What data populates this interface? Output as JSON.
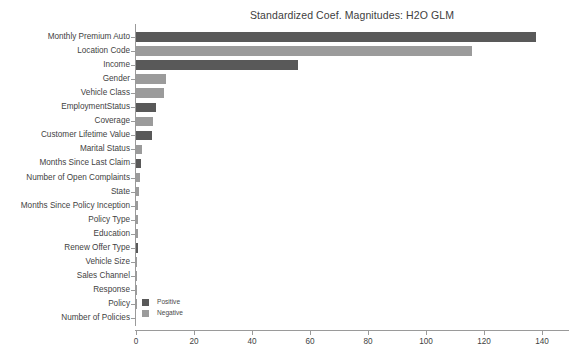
{
  "chart_data": {
    "type": "bar",
    "orientation": "horizontal",
    "title": "Standardized Coef. Magnitudes: H2O GLM",
    "xlabel": "",
    "ylabel": "",
    "xlim": [
      0,
      140
    ],
    "xticks": [
      0,
      20,
      40,
      60,
      80,
      100,
      120,
      140
    ],
    "xtick_labels": [
      "0",
      "20",
      "40",
      "60",
      "80",
      "100",
      "120",
      "140"
    ],
    "grid": false,
    "legend": {
      "position": "lower-left-inside",
      "entries": [
        {
          "label": "Positive",
          "color": "#595959"
        },
        {
          "label": "Negative",
          "color": "#9b9b9b"
        }
      ]
    },
    "categories": [
      "Monthly Premium Auto",
      "Location Code",
      "Income",
      "Gender",
      "Vehicle Class",
      "EmploymentStatus",
      "Coverage",
      "Customer Lifetime Value",
      "Marital Status",
      "Months Since Last Claim",
      "Number of Open Complaints",
      "State",
      "Months Since Policy Inception",
      "Policy Type",
      "Education",
      "Renew Offer Type",
      "Vehicle Size",
      "Sales Channel",
      "Response",
      "Policy",
      "Number of Policies"
    ],
    "values": [
      138.0,
      116.0,
      56.0,
      10.5,
      9.5,
      7.0,
      6.0,
      5.5,
      1.9,
      1.6,
      1.5,
      1.1,
      0.7,
      0.6,
      0.6,
      0.8,
      0.5,
      0.15,
      0.1,
      0.05,
      0.0
    ],
    "signs": [
      "Positive",
      "Negative",
      "Positive",
      "Negative",
      "Negative",
      "Positive",
      "Negative",
      "Positive",
      "Negative",
      "Positive",
      "Negative",
      "Negative",
      "Negative",
      "Negative",
      "Negative",
      "Positive",
      "Negative",
      "Negative",
      "Negative",
      "Negative",
      "Negative"
    ]
  }
}
